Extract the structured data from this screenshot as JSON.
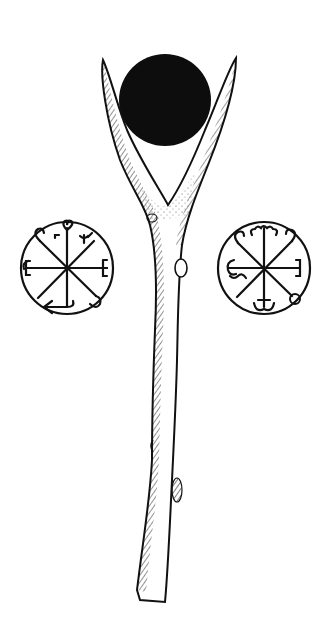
{
  "illustration": {
    "subject": "forked-divining-rod-with-sigils",
    "colors": {
      "ink": "#111111",
      "paper": "#ffffff",
      "sun": "#0d0d0d"
    },
    "sun_disc": {
      "cx": 165,
      "cy": 100,
      "r": 46
    },
    "rod": {
      "left_tip": [
        103,
        60
      ],
      "right_tip": [
        236,
        58
      ],
      "fork": [
        168,
        215
      ],
      "bottom": [
        150,
        600
      ]
    },
    "sigils": [
      {
        "name": "left-sigil",
        "cx": 67,
        "cy": 268,
        "r": 47,
        "glyphs": [
          "heart-scroll",
          "trident-crook",
          "E",
          "E",
          "hook",
          "arrow-left"
        ]
      },
      {
        "name": "right-sigil",
        "cx": 264,
        "cy": 268,
        "r": 47,
        "glyphs": [
          "cloud-scroll",
          "crook",
          "crook",
          "E",
          "G-squiggle",
          "anchor",
          "ring"
        ]
      }
    ]
  }
}
